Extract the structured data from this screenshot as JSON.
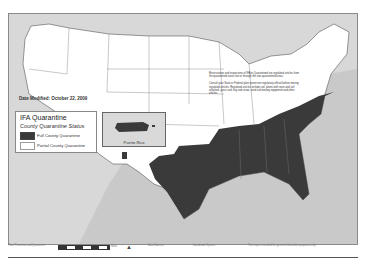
{
  "map": {
    "subject": "Imported Fire Ant quarantine map of the contiguous United States",
    "date_modified": "Date Modified: October 22, 2009",
    "colors": {
      "ocean": "#c9c9c9",
      "state_fill": "#ffffff",
      "full_quarantine": "#3a3a3a",
      "border": "#555555"
    }
  },
  "legend": {
    "title": "IFA Quarantine",
    "subtitle": "County Quarantine Status",
    "items": [
      {
        "label": "Full County Quarantine",
        "color": "#3a3a3a"
      },
      {
        "label": "Partial County Quarantine",
        "color": "#ffffff"
      }
    ]
  },
  "inset": {
    "label": "Puerto Rico"
  },
  "notes": {
    "paragraph1": "Reservations and inspections of IFA in Quarantined are regulated articles from the quarantined areas into or through the non-quarantined areas.",
    "paragraph2": "Consult your State or Federal plant protection regulatory official before moving regulated articles. Regulated articles include soil, plants with roots and soil attached, grass sod, hay and straw, used soil-moving equipment and other articles."
  },
  "footer": {
    "left": "Plant Protection and Quarantine",
    "scale_label": "Miles",
    "scale_ticks": [
      "0",
      "100",
      "200",
      "300",
      "400"
    ],
    "data_sources": "Data Sources",
    "coordinate_system": "Coordinate System",
    "disclaimer": "This map is intended for general information purposes only."
  }
}
